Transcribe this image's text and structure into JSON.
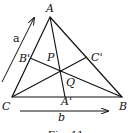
{
  "figure": {
    "caption": "Fig. 11",
    "points": {
      "A": "A",
      "B": "B",
      "C": "C",
      "A_prime": "A'",
      "B_prime": "B'",
      "C_prime": "C'",
      "P": "P",
      "Q": "Q"
    },
    "vectors": {
      "a": "a",
      "b": "b"
    },
    "colors": {
      "stroke": "#111111",
      "background": "#ffffff"
    }
  }
}
